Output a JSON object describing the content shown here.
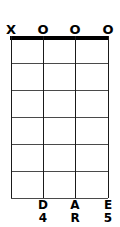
{
  "diagram": {
    "type": "guitar-chord-diagram",
    "string_count": 4,
    "fret_count": 6,
    "nut_shown": true,
    "colors": {
      "ink": "#000000",
      "fret": "#4a4a4a",
      "string": "#1a1a1a",
      "background": "#ffffff"
    },
    "strings": [
      {
        "index": 1,
        "x": 11,
        "marker": "X",
        "marker_name": "muted",
        "note": "",
        "octave": ""
      },
      {
        "index": 2,
        "x": 43,
        "marker": "O",
        "marker_name": "open",
        "note": "D",
        "octave": "4"
      },
      {
        "index": 3,
        "x": 75,
        "marker": "O",
        "marker_name": "open",
        "note": "A",
        "octave": "R"
      },
      {
        "index": 4,
        "x": 108,
        "marker": "O",
        "marker_name": "open",
        "note": "E",
        "octave": "5"
      }
    ],
    "fret_y": [
      27,
      54,
      81,
      108,
      135,
      162
    ]
  }
}
